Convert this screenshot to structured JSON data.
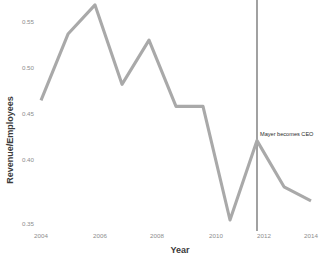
{
  "chart_data": {
    "type": "line",
    "title": "",
    "xlabel": "Year",
    "ylabel": "Revenue/Employees",
    "x": [
      2004,
      2005,
      2006,
      2007,
      2008,
      2009,
      2010,
      2011,
      2012,
      2013,
      2014
    ],
    "values": [
      0.471,
      0.537,
      0.566,
      0.487,
      0.531,
      0.465,
      0.465,
      0.352,
      0.431,
      0.385,
      0.371
    ],
    "series": [
      {
        "name": "Revenue/Employees",
        "values": [
          0.471,
          0.537,
          0.566,
          0.487,
          0.531,
          0.465,
          0.465,
          0.352,
          0.431,
          0.385,
          0.371
        ],
        "color": "#a9a9a9"
      }
    ],
    "xlim": [
      2003.4,
      2014.5
    ],
    "ylim": [
      0.345,
      0.572
    ],
    "xticks": [
      2004,
      2006,
      2008,
      2010,
      2012,
      2014
    ],
    "xticklabels": [
      "2004",
      "2006",
      "2008",
      "2010",
      "2012",
      "2014"
    ],
    "yticks": [
      0.35,
      0.4,
      0.45,
      0.5,
      0.55
    ],
    "yticklabels": [
      "0.35",
      "0.40",
      "0.45",
      "0.50",
      "0.55"
    ],
    "grid": false,
    "legend": false,
    "legend_position": "none",
    "annotations": [
      {
        "label": "Mayer becomes CEO",
        "x": 2012,
        "type": "vertical-line",
        "line_color": "#555555",
        "text_color": "#2b2b2b"
      }
    ]
  },
  "axes": {
    "y_label": "Revenue/Employees",
    "x_label": "Year",
    "y_ticks": [
      "0.55",
      "0.50",
      "0.45",
      "0.40",
      "0.35"
    ],
    "x_ticks": [
      "2004",
      "2006",
      "2008",
      "2010",
      "2012",
      "2014"
    ]
  },
  "annotation": {
    "label": "Mayer becomes CEO"
  },
  "colors": {
    "line": "#a9a9a9",
    "annotation_line": "#555555",
    "tick_text": "#8d8d8d",
    "axis_title": "#3a3a3a",
    "background": "#ffffff"
  }
}
